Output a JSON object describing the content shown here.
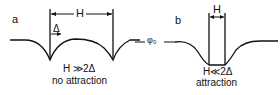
{
  "diagram": {
    "panels": [
      {
        "id": "a",
        "label": "a",
        "spacing_label": "H",
        "width_label": "Δ",
        "condition": "H ≫2Δ",
        "result": "no attraction"
      },
      {
        "id": "b",
        "label": "b",
        "spacing_label": "H",
        "condition": "H≪2Δ",
        "result": "attraction"
      }
    ],
    "baseline_label": "φ₀",
    "line_color": "#111111"
  }
}
